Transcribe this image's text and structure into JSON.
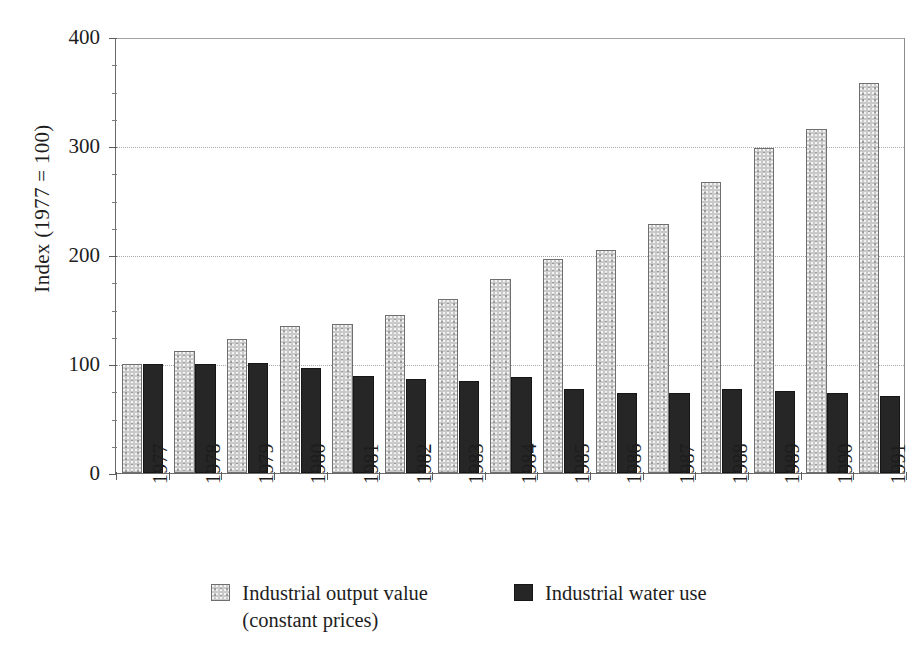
{
  "chart_data": {
    "type": "bar",
    "title": "",
    "subtitle": "",
    "xlabel": "",
    "ylabel": "Index  (1977 = 100)",
    "ylim": [
      0,
      400
    ],
    "yticks": [
      0,
      100,
      200,
      300,
      400
    ],
    "ytick_labels": [
      "0",
      "100",
      "200",
      "300",
      "400"
    ],
    "minor_ytick_step": 25,
    "grid": "horizontal dotted gridlines at 100, 200, 300, 400",
    "legend_position": "bottom-center",
    "categories": [
      "1977",
      "1978",
      "1979",
      "1980",
      "1981",
      "1982",
      "1983",
      "1984",
      "1985",
      "1986",
      "1987",
      "1988",
      "1989",
      "1990",
      "1991"
    ],
    "series": [
      {
        "name": "Industrial output value (constant prices)",
        "color": "#c9c9c9",
        "values": [
          100,
          112,
          123,
          135,
          137,
          145,
          160,
          178,
          196,
          205,
          228,
          267,
          298,
          316,
          358
        ]
      },
      {
        "name": "Industrial water use",
        "color": "#262626",
        "values": [
          100,
          100,
          101,
          96,
          89,
          86,
          84,
          88,
          77,
          73,
          73,
          77,
          75,
          73,
          71
        ]
      }
    ]
  },
  "axis": {
    "y_title": "Index  (1977 = 100)",
    "tick_labels": [
      "400",
      "300",
      "200",
      "100",
      "0"
    ],
    "x_labels": [
      "1977",
      "1978",
      "1979",
      "1980",
      "1981",
      "1982",
      "1983",
      "1984",
      "1985",
      "1986",
      "1987",
      "1988",
      "1989",
      "1990",
      "1991"
    ]
  },
  "legend": {
    "items": [
      {
        "label_line1": "Industrial output value",
        "label_line2": "(constant prices)",
        "swatch": "light-dotted-swatch"
      },
      {
        "label_line1": "Industrial water use",
        "label_line2": "",
        "swatch": "dark-solid-swatch"
      }
    ]
  }
}
